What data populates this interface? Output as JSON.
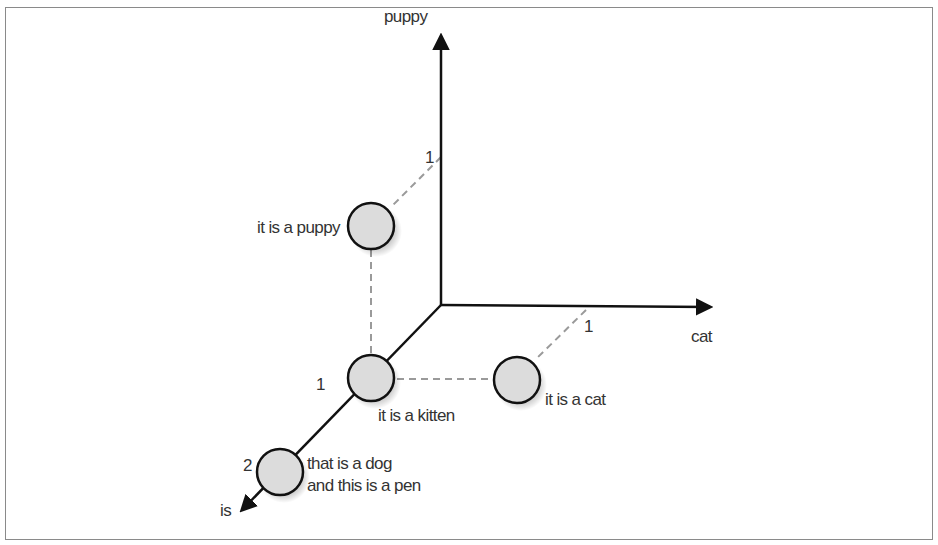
{
  "diagram": {
    "type": "3d-vector-space",
    "axes": {
      "puppy": {
        "label": "puppy",
        "tick": "1"
      },
      "cat": {
        "label": "cat",
        "tick": "1"
      },
      "is": {
        "label": "is",
        "ticks": [
          "1",
          "2"
        ]
      }
    },
    "points": [
      {
        "label": "it is a puppy",
        "coords": {
          "is": 1,
          "cat": 0,
          "puppy": 1
        }
      },
      {
        "label": "it is a kitten",
        "coords": {
          "is": 1,
          "cat": 0,
          "puppy": 0
        }
      },
      {
        "label": "it is a cat",
        "coords": {
          "is": 1,
          "cat": 1,
          "puppy": 0
        }
      },
      {
        "label_line1": "that is a dog",
        "label_line2": "and this is a pen",
        "coords": {
          "is": 2,
          "cat": 0,
          "puppy": 0
        }
      }
    ],
    "colors": {
      "axis": "#111111",
      "dashed": "#9a9a9a",
      "point_fill": "#dcdcdc",
      "point_stroke": "#111111",
      "frame": "#8a8a8a"
    }
  }
}
